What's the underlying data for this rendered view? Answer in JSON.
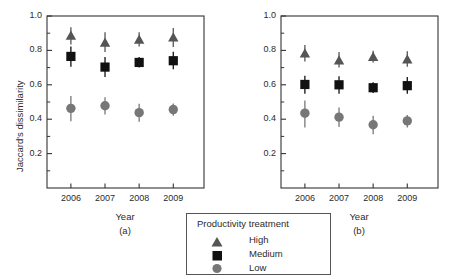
{
  "figure": {
    "ylabel": "Jaccard's dissimilarity",
    "xlabel_a": "Year",
    "xlabel_b": "Year",
    "panel_a_tag": "(a)",
    "panel_b_tag": "(b)"
  },
  "legend": {
    "title": "Productivity treatment",
    "entries": [
      {
        "label": "High",
        "marker": "triangle",
        "color": "#555555"
      },
      {
        "label": "Medium",
        "marker": "square",
        "color": "#111111"
      },
      {
        "label": "Low",
        "marker": "circle",
        "color": "#777777"
      }
    ]
  },
  "colors": {
    "high": "#555555",
    "medium": "#111111",
    "low": "#777777",
    "axis": "#333333",
    "text": "#2b2b2b",
    "background": "#ffffff"
  },
  "chart_data": [
    {
      "type": "scatter",
      "panel": "(a)",
      "title": "",
      "xlabel": "Year",
      "ylabel": "Jaccard's dissimilarity",
      "categories": [
        "2006",
        "2007",
        "2008",
        "2009"
      ],
      "x": [
        2006,
        2007,
        2008,
        2009
      ],
      "xlim": [
        2005.3,
        2009.9
      ],
      "ylim": [
        0.0,
        1.0
      ],
      "ytick_labels": [
        "0.2",
        "0.4",
        "0.6",
        "0.8",
        "1.0"
      ],
      "yticks": [
        0.2,
        0.4,
        0.6,
        0.8,
        1.0
      ],
      "yticks_minor": [
        0.1,
        0.3,
        0.5,
        0.7,
        0.9
      ],
      "grid": false,
      "legend_position": "below-center",
      "series": [
        {
          "name": "High",
          "marker": "triangle",
          "color": "#555555",
          "values": [
            0.885,
            0.845,
            0.862,
            0.875
          ],
          "err_low": [
            0.835,
            0.79,
            0.822,
            0.82
          ],
          "err_high": [
            0.935,
            0.905,
            0.905,
            0.93
          ]
        },
        {
          "name": "Medium",
          "marker": "square",
          "color": "#111111",
          "values": [
            0.765,
            0.703,
            0.73,
            0.74
          ],
          "err_low": [
            0.705,
            0.645,
            0.7,
            0.69
          ],
          "err_high": [
            0.822,
            0.762,
            0.762,
            0.792
          ]
        },
        {
          "name": "Low",
          "marker": "circle",
          "color": "#777777",
          "values": [
            0.463,
            0.478,
            0.438,
            0.456
          ],
          "err_low": [
            0.388,
            0.428,
            0.385,
            0.42
          ],
          "err_high": [
            0.535,
            0.528,
            0.49,
            0.492
          ]
        }
      ]
    },
    {
      "type": "scatter",
      "panel": "(b)",
      "title": "",
      "xlabel": "Year",
      "ylabel": "Jaccard's dissimilarity",
      "categories": [
        "2006",
        "2007",
        "2008",
        "2009"
      ],
      "x": [
        2006,
        2007,
        2008,
        2009
      ],
      "xlim": [
        2005.3,
        2009.9
      ],
      "ylim": [
        0.0,
        1.0
      ],
      "ytick_labels": [
        "0.2",
        "0.4",
        "0.6",
        "0.8",
        "1.0"
      ],
      "yticks": [
        0.2,
        0.4,
        0.6,
        0.8,
        1.0
      ],
      "yticks_minor": [
        0.1,
        0.3,
        0.5,
        0.7,
        0.9
      ],
      "grid": false,
      "legend_position": "below-center",
      "series": [
        {
          "name": "High",
          "marker": "triangle",
          "color": "#555555",
          "values": [
            0.782,
            0.742,
            0.762,
            0.748
          ],
          "err_low": [
            0.735,
            0.7,
            0.73,
            0.705
          ],
          "err_high": [
            0.832,
            0.79,
            0.798,
            0.795
          ]
        },
        {
          "name": "Medium",
          "marker": "square",
          "color": "#111111",
          "values": [
            0.602,
            0.6,
            0.583,
            0.595
          ],
          "err_low": [
            0.548,
            0.548,
            0.552,
            0.548
          ],
          "err_high": [
            0.652,
            0.65,
            0.615,
            0.645
          ]
        },
        {
          "name": "Low",
          "marker": "circle",
          "color": "#777777",
          "values": [
            0.435,
            0.412,
            0.368,
            0.39
          ],
          "err_low": [
            0.352,
            0.355,
            0.312,
            0.352
          ],
          "err_high": [
            0.508,
            0.468,
            0.42,
            0.425
          ]
        }
      ]
    }
  ]
}
